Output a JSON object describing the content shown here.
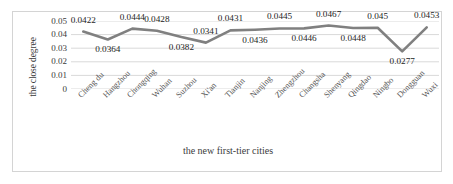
{
  "chart_data": {
    "type": "line",
    "title": "",
    "xlabel": "the new first-tier cities",
    "ylabel": "the close degree",
    "categories": [
      "Cheng du",
      "Hangzhou",
      "Chongqing",
      "Wuhan",
      "Suzhou",
      "Xi'an",
      "Tianjin",
      "Nanjing",
      "Zhengzhou",
      "Changsha",
      "Shenyang",
      "Qingdao",
      "Ningbo",
      "Dongguan",
      "Wuxi"
    ],
    "values": [
      0.0422,
      0.0364,
      0.0444,
      0.0428,
      0.0382,
      0.0341,
      0.0431,
      0.0436,
      0.0445,
      0.0446,
      0.0467,
      0.0448,
      0.045,
      0.0277,
      0.0453
    ],
    "value_labels": [
      "0.0422",
      "0.0364",
      "0.0444",
      "0.0428",
      "0.0382",
      "0.0341",
      "0.0431",
      "0.0436",
      "0.0445",
      "0.0446",
      "0.0467",
      "0.0448",
      "0.045",
      "0.0277",
      "0.0453"
    ],
    "label_positions": [
      "above",
      "below",
      "above",
      "above",
      "below",
      "above",
      "above",
      "below",
      "above",
      "below",
      "above",
      "below",
      "above",
      "below",
      "above"
    ],
    "ylim": [
      0,
      0.05
    ],
    "ytick_labels": [
      "0.05",
      "0.04",
      "0.03",
      "0.02",
      "0.01",
      "0"
    ],
    "ytick_values": [
      0.05,
      0.04,
      0.03,
      0.02,
      0.01,
      0
    ],
    "grid": true,
    "legend": "none",
    "series_color": "#808080",
    "grid_color": "#d9d9d9"
  }
}
